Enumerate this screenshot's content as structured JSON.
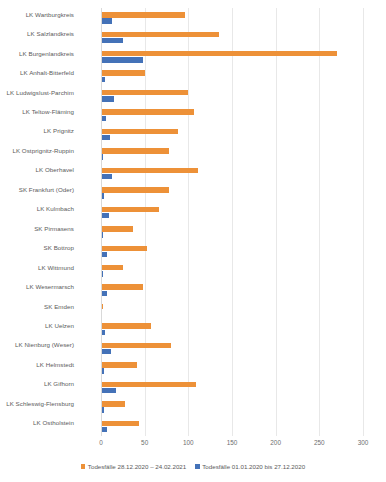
{
  "chart_data": {
    "type": "bar",
    "orientation": "horizontal",
    "title": "",
    "xlabel": "",
    "ylabel": "",
    "xlim": [
      0,
      300
    ],
    "xticks": [
      0,
      50,
      100,
      150,
      200,
      250,
      300
    ],
    "xtick_labels": [
      "0",
      "50",
      "100",
      "150",
      "200",
      "250",
      "300"
    ],
    "grid": true,
    "legend_position": "bottom",
    "categories": [
      "LK Wartburgkreis",
      "LK Salzlandkreis",
      "LK Burgenlandkreis",
      "LK Anhalt-Bitterfeld",
      "LK Ludwigslust-Parchim",
      "LK Teltow-Fläming",
      "LK Prignitz",
      "LK Ostprignitz-Ruppin",
      "LK Oberhavel",
      "SK Frankfurt (Oder)",
      "LK Kulmbach",
      "SK Pirmasens",
      "SK Bottrop",
      "LK Wittmund",
      "LK Wesermarsch",
      "SK Emden",
      "LK Uelzen",
      "LK Nienburg (Weser)",
      "LK Helmstedt",
      "LK Gifhorn",
      "LK Schleswig-Flensburg",
      "LK Ostholstein"
    ],
    "series": [
      {
        "name": "Todesfälle 28.12.2020 – 24.02.2021",
        "color": "#ED9138",
        "values": [
          96,
          135,
          270,
          50,
          100,
          107,
          88,
          78,
          111,
          78,
          66,
          37,
          53,
          25,
          48,
          2,
          57,
          80,
          41,
          109,
          28,
          44
        ]
      },
      {
        "name": "Todesfälle 01.01.2020 bis 27.12.2020",
        "color": "#4472B8",
        "values": [
          13,
          25,
          48,
          5,
          15,
          6,
          10,
          2,
          13,
          3,
          9,
          2,
          7,
          2,
          7,
          1,
          5,
          12,
          3,
          17,
          4,
          7
        ]
      }
    ]
  },
  "legend": {
    "items": [
      {
        "label": "Todesfälle 28.12.2020 – 24.02.2021",
        "color": "#ED9138"
      },
      {
        "label": "Todesfälle 01.01.2020 bis 27.12.2020",
        "color": "#4472B8"
      }
    ]
  }
}
